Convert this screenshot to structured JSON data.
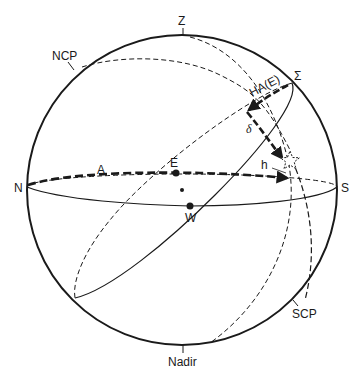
{
  "diagram": {
    "type": "celestial-sphere",
    "labels": {
      "zenith": "Z",
      "ncp": "NCP",
      "sigma": "Σ",
      "hour_angle": "HA(E)",
      "declination": "δ",
      "altitude": "h",
      "azimuth": "A",
      "north": "N",
      "south": "S",
      "east": "E",
      "west": "W",
      "scp": "SCP",
      "nadir": "Nadir"
    },
    "colors": {
      "ink": "#1a1a1a",
      "background": "#ffffff"
    }
  }
}
